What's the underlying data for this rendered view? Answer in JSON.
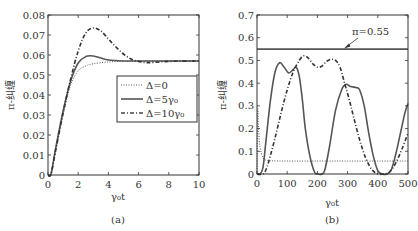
{
  "chart_data": [
    {
      "id": "a",
      "type": "line",
      "caption": "(a)",
      "xlabel": "γ₀t",
      "ylabel": "π-纠缠",
      "xlim": [
        0,
        10
      ],
      "ylim": [
        0,
        0.08
      ],
      "xticks": [
        "0",
        "2",
        "4",
        "6",
        "8",
        "10"
      ],
      "yticks": [
        "0",
        "0.01",
        "0.02",
        "0.03",
        "0.04",
        "0.05",
        "0.06",
        "0.07",
        "0.08"
      ],
      "grid": false,
      "legend_position": "center-right",
      "series": [
        {
          "name": "Δ=0",
          "style": "dotted",
          "x": [
            0,
            0.2,
            0.5,
            1.0,
            1.5,
            2.0,
            2.5,
            3.0,
            4.0,
            5.0,
            6.0,
            8.0,
            10.0
          ],
          "values": [
            0,
            0.0005,
            0.012,
            0.03,
            0.045,
            0.052,
            0.0545,
            0.0556,
            0.0565,
            0.0568,
            0.0569,
            0.057,
            0.057
          ]
        },
        {
          "name": "Δ=5γ₀",
          "style": "solid",
          "x": [
            0,
            0.2,
            0.5,
            1.0,
            1.5,
            2.0,
            2.5,
            3.0,
            3.5,
            4.0,
            5.0,
            6.0,
            8.0,
            10.0
          ],
          "values": [
            0,
            0.0005,
            0.013,
            0.032,
            0.047,
            0.056,
            0.0592,
            0.0595,
            0.0585,
            0.0575,
            0.057,
            0.057,
            0.057,
            0.057
          ]
        },
        {
          "name": "Δ=10γ₀",
          "style": "dashdot",
          "x": [
            0,
            0.2,
            0.5,
            1.0,
            1.5,
            2.0,
            2.5,
            3.0,
            3.5,
            4.0,
            4.5,
            5.0,
            5.5,
            6.0,
            6.5,
            7.0,
            8.0,
            10.0
          ],
          "values": [
            0,
            0.0005,
            0.012,
            0.031,
            0.048,
            0.062,
            0.071,
            0.0735,
            0.072,
            0.068,
            0.064,
            0.0605,
            0.058,
            0.0568,
            0.0562,
            0.0563,
            0.0568,
            0.057
          ]
        }
      ]
    },
    {
      "id": "b",
      "type": "line",
      "caption": "(b)",
      "xlabel": "γ₀t",
      "ylabel": "π-纠缠",
      "xlim": [
        0,
        500
      ],
      "ylim": [
        0,
        0.7
      ],
      "xticks": [
        "0",
        "100",
        "200",
        "300",
        "400",
        "500"
      ],
      "yticks": [
        "0",
        "0.1",
        "0.2",
        "0.3",
        "0.4",
        "0.5",
        "0.6",
        "0.7"
      ],
      "grid": false,
      "annotations": [
        {
          "text": "π=0.55",
          "x": 300,
          "y": 0.55,
          "arrow": true
        }
      ],
      "series": [
        {
          "name": "π=0.55 (reference)",
          "style": "solid-thick",
          "x": [
            0,
            500
          ],
          "values": [
            0.55,
            0.55
          ]
        },
        {
          "name": "Δ=0",
          "style": "dotted",
          "x": [
            0,
            2,
            5,
            10,
            20,
            35,
            50,
            100,
            200,
            300,
            400,
            500
          ],
          "values": [
            0,
            0.28,
            0.2,
            0.12,
            0.07,
            0.06,
            0.058,
            0.057,
            0.057,
            0.057,
            0.057,
            0.057
          ]
        },
        {
          "name": "Δ=5γ₀",
          "style": "solid",
          "x": [
            0,
            10,
            20,
            30,
            45,
            60,
            75,
            90,
            105,
            120,
            130,
            140,
            150,
            160,
            175,
            190,
            200,
            215,
            225,
            240,
            260,
            280,
            295,
            310,
            330,
            340,
            355,
            370,
            385,
            400,
            415,
            430,
            445,
            460,
            475,
            490,
            500
          ],
          "values": [
            0,
            0.0,
            0.03,
            0.15,
            0.33,
            0.45,
            0.49,
            0.47,
            0.445,
            0.46,
            0.47,
            0.43,
            0.33,
            0.2,
            0.08,
            0.01,
            0.0,
            0.0,
            0.02,
            0.12,
            0.28,
            0.37,
            0.395,
            0.385,
            0.38,
            0.37,
            0.3,
            0.18,
            0.08,
            0.015,
            0.0,
            0.0,
            0.02,
            0.09,
            0.18,
            0.27,
            0.31
          ]
        },
        {
          "name": "Δ=10γ₀",
          "style": "dashdot",
          "x": [
            0,
            20,
            30,
            40,
            60,
            80,
            100,
            120,
            140,
            155,
            170,
            185,
            200,
            215,
            230,
            245,
            260,
            275,
            290,
            305,
            320,
            340,
            360,
            380,
            400,
            420,
            440,
            460,
            480,
            500
          ],
          "values": [
            0,
            0.0,
            0.02,
            0.06,
            0.16,
            0.27,
            0.37,
            0.45,
            0.5,
            0.52,
            0.51,
            0.485,
            0.47,
            0.475,
            0.495,
            0.505,
            0.5,
            0.47,
            0.4,
            0.33,
            0.25,
            0.15,
            0.07,
            0.02,
            0.0,
            0.0,
            0.01,
            0.05,
            0.11,
            0.18
          ]
        }
      ]
    }
  ]
}
